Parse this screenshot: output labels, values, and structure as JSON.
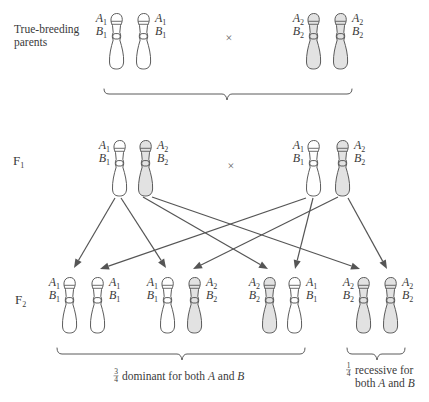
{
  "figure": {
    "row_labels": {
      "parents": {
        "line1": "True-breeding",
        "line2": "parents"
      },
      "f1": {
        "base": "F",
        "sub": "1"
      },
      "f2": {
        "base": "F",
        "sub": "2"
      }
    },
    "cross_symbol": "×",
    "chromosomes": {
      "parents": [
        {
          "a": {
            "letter": "A",
            "sub": "1"
          },
          "b": {
            "letter": "B",
            "sub": "1"
          },
          "fill": "#ffffff",
          "label_side": "left"
        },
        {
          "a": {
            "letter": "A",
            "sub": "1"
          },
          "b": {
            "letter": "B",
            "sub": "1"
          },
          "fill": "#ffffff",
          "label_side": "right"
        },
        {
          "a": {
            "letter": "A",
            "sub": "2"
          },
          "b": {
            "letter": "B",
            "sub": "2"
          },
          "fill": "#e2e2e2",
          "label_side": "left"
        },
        {
          "a": {
            "letter": "A",
            "sub": "2"
          },
          "b": {
            "letter": "B",
            "sub": "2"
          },
          "fill": "#e2e2e2",
          "label_side": "right"
        }
      ],
      "f1": [
        {
          "a": {
            "letter": "A",
            "sub": "1"
          },
          "b": {
            "letter": "B",
            "sub": "1"
          },
          "fill": "#ffffff",
          "label_side": "left"
        },
        {
          "a": {
            "letter": "A",
            "sub": "2"
          },
          "b": {
            "letter": "B",
            "sub": "2"
          },
          "fill": "#e2e2e2",
          "label_side": "right"
        },
        {
          "a": {
            "letter": "A",
            "sub": "1"
          },
          "b": {
            "letter": "B",
            "sub": "1"
          },
          "fill": "#ffffff",
          "label_side": "left"
        },
        {
          "a": {
            "letter": "A",
            "sub": "2"
          },
          "b": {
            "letter": "B",
            "sub": "2"
          },
          "fill": "#e2e2e2",
          "label_side": "right"
        }
      ],
      "f2": [
        {
          "a": {
            "letter": "A",
            "sub": "1"
          },
          "b": {
            "letter": "B",
            "sub": "1"
          },
          "fill": "#ffffff",
          "label_side": "left"
        },
        {
          "a": {
            "letter": "A",
            "sub": "1"
          },
          "b": {
            "letter": "B",
            "sub": "1"
          },
          "fill": "#ffffff",
          "label_side": "right"
        },
        {
          "a": {
            "letter": "A",
            "sub": "1"
          },
          "b": {
            "letter": "B",
            "sub": "1"
          },
          "fill": "#ffffff",
          "label_side": "left"
        },
        {
          "a": {
            "letter": "A",
            "sub": "2"
          },
          "b": {
            "letter": "B",
            "sub": "2"
          },
          "fill": "#e2e2e2",
          "label_side": "right"
        },
        {
          "a": {
            "letter": "A",
            "sub": "2"
          },
          "b": {
            "letter": "B",
            "sub": "2"
          },
          "fill": "#e2e2e2",
          "label_side": "left"
        },
        {
          "a": {
            "letter": "A",
            "sub": "1"
          },
          "b": {
            "letter": "B",
            "sub": "1"
          },
          "fill": "#ffffff",
          "label_side": "right"
        },
        {
          "a": {
            "letter": "A",
            "sub": "2"
          },
          "b": {
            "letter": "B",
            "sub": "2"
          },
          "fill": "#e2e2e2",
          "label_side": "left"
        },
        {
          "a": {
            "letter": "A",
            "sub": "2"
          },
          "b": {
            "letter": "B",
            "sub": "2"
          },
          "fill": "#e2e2e2",
          "label_side": "right"
        }
      ]
    },
    "arrows": [
      {
        "from": "f1.0",
        "to": "f2.0"
      },
      {
        "from": "f1.0",
        "to": "f2.2"
      },
      {
        "from": "f1.1",
        "to": "f2.4"
      },
      {
        "from": "f1.1",
        "to": "f2.6"
      },
      {
        "from": "f1.2",
        "to": "f2.1"
      },
      {
        "from": "f1.2",
        "to": "f2.5"
      },
      {
        "from": "f1.3",
        "to": "f2.3"
      },
      {
        "from": "f1.3",
        "to": "f2.7"
      }
    ],
    "outcomes": {
      "dominant": {
        "fraction": {
          "num": "3",
          "den": "4"
        },
        "text": "dominant for both ",
        "a": "A",
        "and": " and ",
        "b": "B"
      },
      "recessive": {
        "fraction": {
          "num": "1",
          "den": "4"
        },
        "line1": "recessive for",
        "line2_pre": "both ",
        "a": "A",
        "and": " and ",
        "b": "B"
      }
    },
    "colors": {
      "outline": "#4a4a4a",
      "dominant_fill": "#ffffff",
      "recessive_fill": "#e2e2e2",
      "arrow": "#555555",
      "text": "#3a3a3a"
    }
  }
}
